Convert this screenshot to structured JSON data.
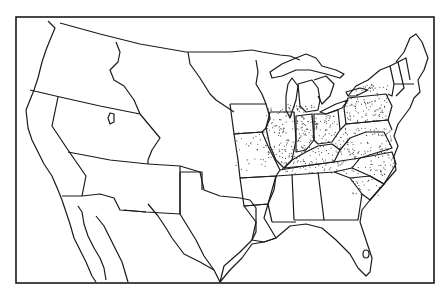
{
  "map": {
    "type": "historical outline map",
    "subject": "United States with territorial boundaries",
    "style": "black-and-white line drawing",
    "stippled_regions": [
      "Michigan (southern)",
      "Wisconsin (southern)",
      "Iowa (eastern)",
      "Illinois",
      "Indiana",
      "Ohio",
      "Missouri (eastern)",
      "Kentucky",
      "Tennessee",
      "Pennsylvania",
      "New York (western/central)",
      "Maryland",
      "Virginia",
      "North Carolina",
      "South Carolina (upper)"
    ],
    "colors": {
      "background": "#ffffff",
      "lines": "#1a1a1a",
      "stipple": "#333333"
    }
  }
}
